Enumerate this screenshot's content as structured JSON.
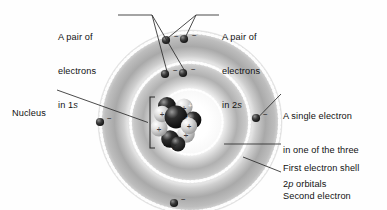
{
  "figure": {
    "background_color": "#fefefe",
    "line_color": "#2a2a2a",
    "text_color": "#121212"
  },
  "labels": {
    "pair_1s": {
      "line1": "A pair of",
      "line2": "electrons",
      "line3_prefix": "in 1",
      "line3_italic": "s"
    },
    "pair_2s": {
      "line1": "A pair of",
      "line2": "electrons",
      "line3_prefix": "in 2",
      "line3_italic": "s"
    },
    "nucleus": {
      "line1": "Nucleus"
    },
    "single_2p": {
      "line1": "A single electron",
      "line2": "in one of the three",
      "line3_prefix": "2",
      "line3_italic": "p",
      "line3_suffix": " orbitals"
    },
    "first_shell": {
      "line1": "First electron shell"
    },
    "second_shell": {
      "line1": "Second electron",
      "line2": "shell"
    }
  },
  "diagram": {
    "center": {
      "x": 190,
      "y": 122
    },
    "shells": [
      {
        "name": "first-electron-shell",
        "inner_radius": 33,
        "outer_radius": 62,
        "ring_fill_light": "#f4f4f4",
        "ring_fill_dark": "#b2b2b2",
        "stipple_color": "#ffffff"
      },
      {
        "name": "second-electron-shell",
        "inner_radius": 62,
        "outer_radius": 92,
        "ring_fill_light": "#f0f0f0",
        "ring_fill_dark": "#a8a8a8",
        "stipple_color": "#ffffff"
      }
    ],
    "electrons": [
      {
        "name": "electron-1s-a",
        "x": 165,
        "y": 74,
        "shell": "first",
        "charge": "-"
      },
      {
        "name": "electron-1s-b",
        "x": 183,
        "y": 73,
        "shell": "first",
        "charge": "-"
      },
      {
        "name": "electron-2s-a",
        "x": 166,
        "y": 40,
        "shell": "second",
        "charge": "-"
      },
      {
        "name": "electron-2s-b",
        "x": 184,
        "y": 39,
        "shell": "second",
        "charge": "-"
      },
      {
        "name": "electron-2p-right",
        "x": 256,
        "y": 118,
        "shell": "second",
        "charge": "-"
      },
      {
        "name": "electron-2p-left",
        "x": 100,
        "y": 122,
        "shell": "second",
        "charge": "-"
      },
      {
        "name": "electron-2p-bottom",
        "x": 174,
        "y": 203,
        "shell": "second",
        "charge": "-"
      }
    ],
    "nucleus": {
      "name": "nucleus-cluster",
      "center": {
        "x": 175,
        "y": 122
      },
      "radius": 24,
      "proton_symbol": "+",
      "proton_color": "#d9d9d9",
      "neutron_color": "#1a1a1a",
      "particles": [
        {
          "type": "neutron",
          "x": 167,
          "y": 106,
          "r": 9.0
        },
        {
          "type": "proton",
          "x": 184,
          "y": 107,
          "r": 8.6
        },
        {
          "type": "neutron",
          "x": 192,
          "y": 119,
          "r": 8.4
        },
        {
          "type": "proton",
          "x": 186,
          "y": 134,
          "r": 8.6
        },
        {
          "type": "neutron",
          "x": 170,
          "y": 139,
          "r": 8.8
        },
        {
          "type": "proton",
          "x": 159,
          "y": 127,
          "r": 8.4
        },
        {
          "type": "proton",
          "x": 161,
          "y": 114,
          "r": 8.2
        },
        {
          "type": "neutron",
          "x": 176,
          "y": 113,
          "r": 11.5
        }
      ]
    },
    "nucleus_bracket": {
      "x": 150,
      "y_top": 97,
      "y_bottom": 148,
      "arm": 5
    },
    "leaders": [
      {
        "name": "leader-1s",
        "points": [
          [
            122,
            15
          ],
          [
            152,
            15
          ],
          [
            166,
            72
          ]
        ]
      },
      {
        "name": "leader-1s-b",
        "points": [
          [
            152,
            15
          ],
          [
            184,
            71
          ]
        ]
      },
      {
        "name": "leader-2s",
        "points": [
          [
            219,
            15
          ],
          [
            196,
            15
          ],
          [
            185,
            37
          ]
        ]
      },
      {
        "name": "leader-2s-b",
        "points": [
          [
            196,
            15
          ],
          [
            167,
            38
          ]
        ]
      },
      {
        "name": "leader-nucleus",
        "points": [
          [
            58,
            90
          ],
          [
            148,
            122
          ]
        ]
      },
      {
        "name": "leader-2p",
        "points": [
          [
            280,
            94
          ],
          [
            258,
            117
          ]
        ]
      },
      {
        "name": "leader-shell1",
        "points": [
          [
            280,
            144
          ],
          [
            224,
            144
          ]
        ]
      },
      {
        "name": "leader-shell2",
        "points": [
          [
            280,
            172
          ],
          [
            244,
            158
          ]
        ]
      }
    ]
  }
}
